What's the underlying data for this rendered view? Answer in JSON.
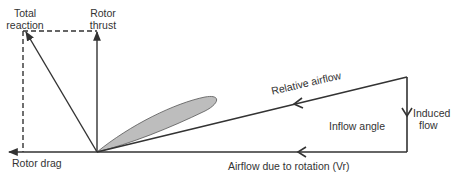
{
  "diagram": {
    "labels": {
      "total_reaction": [
        "Total",
        "reaction"
      ],
      "rotor_thrust": [
        "Rotor",
        "thrust"
      ],
      "rotor_drag": "Rotor drag",
      "relative_airflow": "Relative airflow",
      "inflow_angle": "Inflow angle",
      "induced_flow": [
        "Induced",
        "flow"
      ],
      "airflow_rotation": "Airflow due to rotation (Vr)"
    },
    "colors": {
      "line": "#333333",
      "blade_fill": "#bdbdbd",
      "blade_stroke": "#555555",
      "text": "#333333"
    },
    "nodes": {
      "hub": [
        97,
        152
      ],
      "thrust_tip": [
        97,
        31
      ],
      "reaction_tip": [
        25,
        31
      ],
      "drag_tip": [
        8,
        152
      ],
      "relative_start": [
        407,
        77
      ],
      "induced_end": [
        407,
        152
      ]
    }
  }
}
